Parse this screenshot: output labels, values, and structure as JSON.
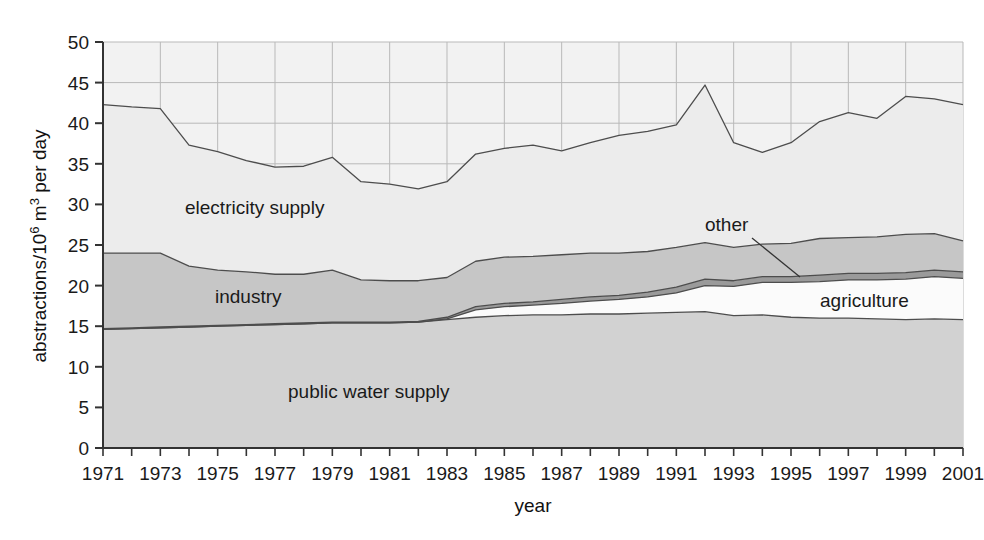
{
  "figure": {
    "background": "#ffffff",
    "plot_background": "#f2f2f2",
    "border_color": "#555555"
  },
  "axes": {
    "y_title_main": "abstractions/10",
    "y_title_sup": "6",
    "y_title_tail": " m",
    "y_title_sup2": "3",
    "y_title_tail2": " per day",
    "y_title_full": "abstractions/10⁶ m³ per day",
    "x_title": "year",
    "y_ticks": [
      "0",
      "5",
      "10",
      "15",
      "20",
      "25",
      "30",
      "35",
      "40",
      "45",
      "50"
    ],
    "x_ticks": [
      "1971",
      "1973",
      "1975",
      "1977",
      "1979",
      "1981",
      "1983",
      "1985",
      "1987",
      "1989",
      "1991",
      "1993",
      "1995",
      "1997",
      "1999",
      "2001"
    ]
  },
  "annotations": {
    "electricity": "electricity supply",
    "industry": "industry",
    "public_water": "public water supply",
    "other": "other",
    "agriculture": "agriculture"
  },
  "palette": {
    "public_water_supply": "#d2d2d2",
    "agriculture": "#fbfbfb",
    "other": "#9a9a9a",
    "industry": "#c6c6c6",
    "electricity_supply": "#ececec",
    "line": "#4d4d4d",
    "grid": "#b9b9b9"
  },
  "chart_data": {
    "type": "area",
    "title": "",
    "xlabel": "year",
    "ylabel": "abstractions/10⁶ m³ per day",
    "ylim": [
      0,
      50
    ],
    "xlim": [
      1971,
      2001
    ],
    "grid": true,
    "legend_position": "inline-labels",
    "stacked": true,
    "x": [
      1971,
      1972,
      1973,
      1974,
      1975,
      1976,
      1977,
      1978,
      1979,
      1980,
      1981,
      1982,
      1983,
      1984,
      1985,
      1986,
      1987,
      1988,
      1989,
      1990,
      1991,
      1992,
      1993,
      1994,
      1995,
      1996,
      1997,
      1998,
      1999,
      2000,
      2001
    ],
    "series": [
      {
        "name": "public water supply",
        "color": "#d2d2d2",
        "values": [
          14.6,
          14.7,
          14.8,
          14.9,
          15.0,
          15.1,
          15.2,
          15.3,
          15.4,
          15.4,
          15.4,
          15.5,
          15.8,
          16.1,
          16.3,
          16.4,
          16.4,
          16.5,
          16.5,
          16.6,
          16.7,
          16.8,
          16.3,
          16.4,
          16.1,
          16.0,
          16.0,
          15.9,
          15.8,
          15.9,
          15.8
        ]
      },
      {
        "name": "agriculture",
        "color": "#fbfbfb",
        "values": [
          0.0,
          0.0,
          0.0,
          0.0,
          0.0,
          0.0,
          0.0,
          0.0,
          0.0,
          0.0,
          0.0,
          0.0,
          0.1,
          0.9,
          1.1,
          1.2,
          1.4,
          1.6,
          1.8,
          2.0,
          2.4,
          3.2,
          3.6,
          4.0,
          4.3,
          4.5,
          4.7,
          4.8,
          5.0,
          5.2,
          5.1
        ]
      },
      {
        "name": "other",
        "color": "#9a9a9a",
        "values": [
          0.1,
          0.1,
          0.1,
          0.1,
          0.1,
          0.1,
          0.1,
          0.1,
          0.1,
          0.1,
          0.1,
          0.1,
          0.2,
          0.4,
          0.4,
          0.4,
          0.5,
          0.5,
          0.5,
          0.6,
          0.7,
          0.8,
          0.7,
          0.7,
          0.7,
          0.8,
          0.8,
          0.8,
          0.8,
          0.8,
          0.8
        ]
      },
      {
        "name": "industry",
        "color": "#c6c6c6",
        "values": [
          9.3,
          9.2,
          9.1,
          7.4,
          6.8,
          6.5,
          6.1,
          6.0,
          6.4,
          5.2,
          5.1,
          5.0,
          4.9,
          5.6,
          5.7,
          5.6,
          5.5,
          5.4,
          5.2,
          5.0,
          4.9,
          4.5,
          4.1,
          4.0,
          4.1,
          4.5,
          4.4,
          4.5,
          4.7,
          4.5,
          3.8
        ]
      },
      {
        "name": "electricity supply",
        "color": "#ececec",
        "values": [
          18.3,
          18.0,
          17.8,
          14.9,
          14.6,
          13.7,
          13.2,
          13.3,
          13.9,
          12.1,
          11.9,
          11.3,
          11.8,
          13.2,
          13.4,
          13.7,
          12.8,
          13.6,
          14.5,
          14.8,
          15.1,
          19.4,
          12.9,
          11.3,
          12.4,
          14.4,
          15.4,
          14.6,
          17.0,
          16.6,
          16.8
        ]
      }
    ],
    "totals": [
      42.3,
      42.0,
      41.8,
      37.3,
      36.5,
      35.4,
      34.6,
      35.2,
      35.8,
      32.8,
      32.5,
      32.7,
      32.8,
      36.2,
      36.9,
      37.3,
      36.6,
      37.6,
      38.5,
      39.0,
      39.8,
      44.7,
      37.6,
      36.4,
      37.6,
      40.2,
      41.3,
      40.6,
      43.3,
      43.0,
      42.3
    ]
  }
}
